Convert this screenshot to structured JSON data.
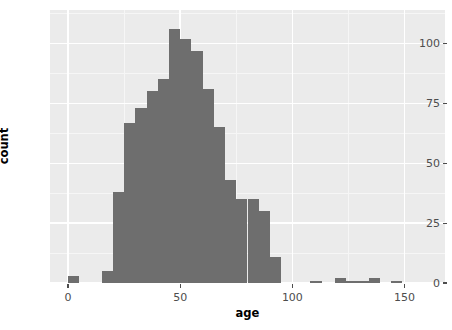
{
  "chart_data": {
    "type": "bar",
    "title": "",
    "subtitle": "",
    "xlabel": "age",
    "ylabel": "count",
    "xlim": [
      -8,
      168
    ],
    "ylim": [
      0,
      114
    ],
    "grid": true,
    "legend": null,
    "bin_width": 5,
    "bar_color": "#6e6e6e",
    "panel_color": "#ebebeb",
    "grid_color": "#ffffff",
    "xticks": [
      0,
      50,
      100,
      150
    ],
    "xtick_labels": [
      "0",
      "50",
      "100",
      "150"
    ],
    "yticks": [
      0,
      25,
      50,
      75,
      100
    ],
    "ytick_labels": [
      "0",
      "25",
      "50",
      "75",
      "100"
    ],
    "bins": [
      {
        "x0": 0,
        "x1": 5,
        "value": 3
      },
      {
        "x0": 15,
        "x1": 20,
        "value": 5
      },
      {
        "x0": 20,
        "x1": 25,
        "value": 38
      },
      {
        "x0": 25,
        "x1": 30,
        "value": 67
      },
      {
        "x0": 30,
        "x1": 35,
        "value": 73
      },
      {
        "x0": 35,
        "x1": 40,
        "value": 80
      },
      {
        "x0": 40,
        "x1": 45,
        "value": 85
      },
      {
        "x0": 45,
        "x1": 50,
        "value": 106
      },
      {
        "x0": 50,
        "x1": 55,
        "value": 102
      },
      {
        "x0": 55,
        "x1": 60,
        "value": 97
      },
      {
        "x0": 60,
        "x1": 65,
        "value": 81
      },
      {
        "x0": 65,
        "x1": 70,
        "value": 65
      },
      {
        "x0": 70,
        "x1": 75,
        "value": 43
      },
      {
        "x0": 75,
        "x1": 80,
        "value": 35
      },
      {
        "x0": 80,
        "x1": 85,
        "value": 35
      },
      {
        "x0": 85,
        "x1": 90,
        "value": 30
      },
      {
        "x0": 90,
        "x1": 95,
        "value": 11
      },
      {
        "x0": 108,
        "x1": 113,
        "value": 1
      },
      {
        "x0": 119,
        "x1": 124,
        "value": 2
      },
      {
        "x0": 124,
        "x1": 129,
        "value": 1
      },
      {
        "x0": 129,
        "x1": 134,
        "value": 1
      },
      {
        "x0": 134,
        "x1": 139,
        "value": 2
      },
      {
        "x0": 144,
        "x1": 149,
        "value": 1
      }
    ]
  }
}
